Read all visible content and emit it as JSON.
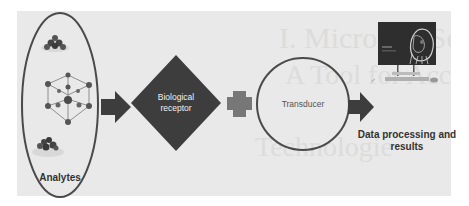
{
  "background_watermark": {
    "line1": "I. Microbial Sensors",
    "line2": "A Tool for Accelerating",
    "line3": "Technologie"
  },
  "steps": [
    {
      "id": "analytes",
      "label": "Analytes",
      "shape": "ellipse"
    },
    {
      "id": "biological-receptor",
      "label_line1": "Biological",
      "label_line2": "receptor",
      "shape": "diamond"
    },
    {
      "id": "transducer",
      "label": "Transducer",
      "shape": "circle"
    },
    {
      "id": "data-processing",
      "label_line1": "Data processing and",
      "label_line2": "results",
      "shape": "computer-image"
    }
  ],
  "connectors": [
    {
      "from": "analytes",
      "to": "biological-receptor",
      "type": "arrow"
    },
    {
      "from": "biological-receptor",
      "to": "transducer",
      "type": "plus"
    },
    {
      "from": "transducer",
      "to": "data-processing",
      "type": "arrow"
    }
  ],
  "colors": {
    "panel_bg": "#e9e9e9",
    "dark_shape": "#3d3d3d",
    "outline": "#4a4a4a",
    "plus": "#777777",
    "monitor_screen": "#2e2e2e"
  }
}
